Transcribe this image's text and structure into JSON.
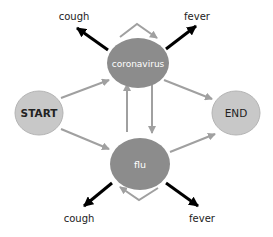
{
  "diagram": {
    "type": "state-transition",
    "nodes": [
      {
        "id": "start",
        "label": "START",
        "kind": "terminal"
      },
      {
        "id": "coronavirus",
        "label": "coronavirus",
        "kind": "hidden-state"
      },
      {
        "id": "flu",
        "label": "flu",
        "kind": "hidden-state"
      },
      {
        "id": "end",
        "label": "END",
        "kind": "terminal"
      }
    ],
    "observations": [
      {
        "id": "cv-cough",
        "label": "cough",
        "from": "coronavirus"
      },
      {
        "id": "cv-fever",
        "label": "fever",
        "from": "coronavirus"
      },
      {
        "id": "flu-cough",
        "label": "cough",
        "from": "flu"
      },
      {
        "id": "flu-fever",
        "label": "fever",
        "from": "flu"
      }
    ],
    "transitions": [
      {
        "from": "start",
        "to": "coronavirus"
      },
      {
        "from": "start",
        "to": "flu"
      },
      {
        "from": "coronavirus",
        "to": "end"
      },
      {
        "from": "flu",
        "to": "end"
      },
      {
        "from": "coronavirus",
        "to": "flu"
      },
      {
        "from": "flu",
        "to": "coronavirus"
      },
      {
        "from": "coronavirus",
        "to": "coronavirus"
      },
      {
        "from": "flu",
        "to": "flu"
      }
    ],
    "colors": {
      "terminal_fill": "#c8c8c8",
      "terminal_stroke": "#b4b4b4",
      "state_fill": "#8c8c8c",
      "transition_arrow": "#a0a0a0",
      "emission_arrow": "#000000",
      "terminal_text": "#222222",
      "state_text": "#ffffff",
      "observation_text": "#222222"
    }
  }
}
